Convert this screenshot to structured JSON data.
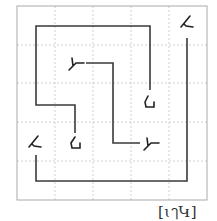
{
  "puzzle": {
    "grid": {
      "cols": 5,
      "rows": 5,
      "frame": [
        17,
        6,
        207,
        200
      ],
      "gridline_color": "#c8c8c8",
      "frame_color": "#b0b0b0"
    },
    "paths": [
      {
        "name": "outer-bracket",
        "points": [
          [
            150,
            90
          ],
          [
            150,
            26
          ],
          [
            36,
            26
          ],
          [
            36,
            105
          ],
          [
            75,
            105
          ],
          [
            75,
            133
          ]
        ]
      },
      {
        "name": "inner-zigzag",
        "points": [
          [
            86,
            63
          ],
          [
            113,
            63
          ],
          [
            113,
            143
          ],
          [
            140,
            143
          ]
        ]
      },
      {
        "name": "bottom-hook",
        "points": [
          [
            187,
            38
          ],
          [
            187,
            181
          ],
          [
            36,
            181
          ],
          [
            36,
            155
          ]
        ]
      }
    ],
    "glyphs": [
      {
        "id": "g1",
        "char": "ム",
        "x": 180,
        "y": 20
      },
      {
        "id": "g2",
        "char": "ム",
        "x": 28,
        "y": 138
      },
      {
        "id": "g3",
        "char": "ト",
        "x": 67,
        "y": 56
      },
      {
        "id": "g4",
        "char": "ト",
        "x": 143,
        "y": 136
      },
      {
        "id": "g5",
        "char": "ᒧ",
        "x": 141,
        "y": 96
      },
      {
        "id": "g6",
        "char": "ᒧ",
        "x": 69,
        "y": 137
      }
    ],
    "line_color": "#3a3a3a",
    "label": "[ɩๅԿ]"
  }
}
